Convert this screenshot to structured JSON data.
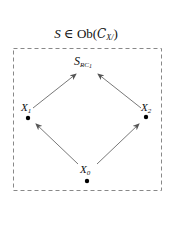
{
  "title": {
    "prefix": "S",
    "relation": "∈",
    "ob": "Ob(",
    "category": "C",
    "subscript": "X/",
    "suffix": ")"
  },
  "nodes": {
    "top": {
      "name": "S",
      "subscript": "RC",
      "subsubscript": "1"
    },
    "left": {
      "name": "X",
      "subscript": "1"
    },
    "right": {
      "name": "X",
      "subscript": "2"
    },
    "bottom": {
      "name": "X",
      "subscript": "0"
    }
  },
  "edges": [
    {
      "from": "X_0",
      "to": "X_1"
    },
    {
      "from": "X_0",
      "to": "X_2"
    },
    {
      "from": "X_1",
      "to": "S_RC1"
    },
    {
      "from": "X_2",
      "to": "S_RC1"
    }
  ],
  "colors": {
    "border": "#888888",
    "arrow": "#555555",
    "dot": "#000000",
    "text": "#111111"
  }
}
